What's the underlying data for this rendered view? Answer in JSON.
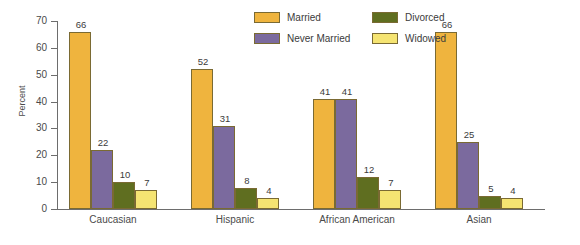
{
  "chart_data": {
    "type": "bar",
    "title": "",
    "xlabel": "",
    "ylabel": "Percent",
    "ylim": [
      0,
      70
    ],
    "yticks": [
      0,
      10,
      20,
      30,
      40,
      50,
      60,
      70
    ],
    "grid": false,
    "legend_position": "top-center",
    "categories": [
      "Caucasian",
      "Hispanic",
      "African American",
      "Asian"
    ],
    "series": [
      {
        "name": "Married",
        "color": "#EFB43E",
        "values": [
          66,
          52,
          41,
          66
        ]
      },
      {
        "name": "Never Married",
        "color": "#7B6A9E",
        "values": [
          22,
          31,
          41,
          25
        ]
      },
      {
        "name": "Divorced",
        "color": "#5F6E20",
        "values": [
          10,
          8,
          12,
          5
        ]
      },
      {
        "name": "Widowed",
        "color": "#F5E472",
        "values": [
          7,
          4,
          7,
          4
        ]
      }
    ]
  },
  "axis": {
    "y_label": "Percent",
    "y_tick_labels": [
      "70",
      "60",
      "50",
      "40",
      "30",
      "20",
      "10",
      "0"
    ]
  },
  "legend": {
    "items": [
      {
        "label": "Married",
        "color": "#EFB43E"
      },
      {
        "label": "Never Married",
        "color": "#7B6A9E"
      },
      {
        "label": "Divorced",
        "color": "#5F6E20"
      },
      {
        "label": "Widowed",
        "color": "#F5E472"
      }
    ]
  },
  "groups": [
    {
      "label": "Caucasian",
      "values": [
        "66",
        "22",
        "10",
        "7"
      ]
    },
    {
      "label": "Hispanic",
      "values": [
        "52",
        "31",
        "8",
        "4"
      ]
    },
    {
      "label": "African American",
      "values": [
        "41",
        "41",
        "12",
        "7"
      ]
    },
    {
      "label": "Asian",
      "values": [
        "66",
        "25",
        "5",
        "4"
      ]
    }
  ]
}
